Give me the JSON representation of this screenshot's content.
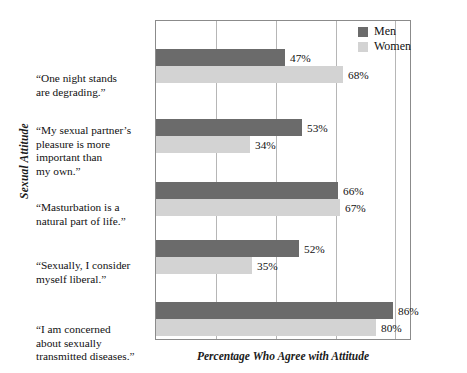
{
  "chart_data": {
    "type": "bar",
    "orientation": "horizontal",
    "title": "",
    "xlabel": "Percentage Who Agree with Attitude",
    "ylabel": "Sexual Attitude",
    "xlim": [
      0,
      93
    ],
    "grid": true,
    "gridlines_x": [
      0,
      21.8,
      43.5,
      65.3,
      87
    ],
    "legend_position": "top-right",
    "categories": [
      "“One night stands are degrading.”",
      "“My sexual partner’s pleasure is more important than my own.”",
      "“Masturbation is a natural part of life.”",
      "“Sexually, I consider myself liberal.”",
      "“I am concerned about sexually transmitted diseases.”"
    ],
    "series": [
      {
        "name": "Men",
        "color": "#6b6b6b",
        "values": [
          47,
          53,
          66,
          52,
          86
        ]
      },
      {
        "name": "Women",
        "color": "#d3d3d3",
        "values": [
          68,
          34,
          67,
          35,
          80
        ]
      }
    ],
    "value_labels": {
      "men": [
        "47%",
        "53%",
        "66%",
        "52%",
        "86%"
      ],
      "women": [
        "68%",
        "34%",
        "67%",
        "35%",
        "80%"
      ]
    }
  },
  "axes": {
    "y_title": "Sexual Attitude",
    "x_title": "Percentage Who Agree with Attitude"
  },
  "legend": {
    "items": [
      {
        "label": "Men",
        "color": "#6b6b6b"
      },
      {
        "label": "Women",
        "color": "#d3d3d3"
      }
    ]
  },
  "category_labels": [
    {
      "lines": [
        "“One night stands",
        "are degrading.”"
      ]
    },
    {
      "lines": [
        "“My sexual partner’s",
        "pleasure is more",
        "important than",
        "my own.”"
      ]
    },
    {
      "lines": [
        "“Masturbation is a",
        "natural part of life.”"
      ]
    },
    {
      "lines": [
        "“Sexually, I consider",
        "myself liberal.”"
      ]
    },
    {
      "lines": [
        "“I am concerned",
        "about sexually",
        "transmitted diseases.”"
      ]
    }
  ],
  "colors": {
    "men_bar": "#6b6b6b",
    "women_bar": "#d3d3d3",
    "plot_border": "#8b8b8b",
    "gridline": "#b6b6b6",
    "text": "#111111",
    "background": "#ffffff"
  }
}
